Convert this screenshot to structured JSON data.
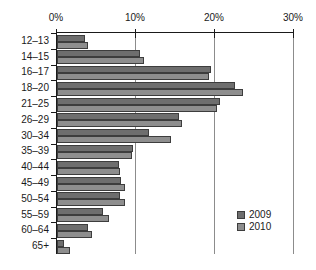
{
  "chart_data": {
    "type": "bar",
    "orientation": "horizontal",
    "title": "",
    "subtitle": "",
    "xlabel": "",
    "ylabel": "",
    "xlim": [
      0,
      30
    ],
    "xticks": [
      0,
      10,
      20,
      30
    ],
    "xtick_labels": [
      "0%",
      "10%",
      "20%",
      "30%"
    ],
    "grid": true,
    "legend_position": "bottom-right",
    "categories": [
      "12–13",
      "14–15",
      "16–17",
      "18–20",
      "21–25",
      "26–29",
      "30–34",
      "35–39",
      "40–44",
      "45–49",
      "50–54",
      "55–59",
      "60–64",
      "65+"
    ],
    "series": [
      {
        "name": "2009",
        "color": "#6e6e6e",
        "values": [
          3.5,
          10.5,
          19.5,
          22.5,
          20.6,
          15.4,
          11.6,
          9.6,
          7.8,
          8.1,
          8.0,
          5.8,
          3.9,
          0.9
        ]
      },
      {
        "name": "2010",
        "color": "#8e8e8e",
        "values": [
          3.9,
          11.0,
          19.2,
          23.5,
          20.3,
          15.8,
          14.4,
          9.5,
          8.0,
          8.6,
          8.6,
          6.6,
          4.4,
          1.6
        ]
      }
    ]
  },
  "legend": {
    "items": [
      {
        "label": "2009",
        "color": "#6e6e6e"
      },
      {
        "label": "2010",
        "color": "#8e8e8e"
      }
    ]
  }
}
